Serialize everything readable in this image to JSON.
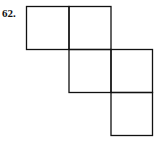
{
  "problem": {
    "number_label": "62."
  },
  "diagram": {
    "type": "square-net",
    "cell_size": 42,
    "stroke": "#111111",
    "cells": [
      {
        "row": 0,
        "col": 0
      },
      {
        "row": 0,
        "col": 1
      },
      {
        "row": 1,
        "col": 1
      },
      {
        "row": 1,
        "col": 2
      },
      {
        "row": 2,
        "col": 2
      }
    ]
  }
}
